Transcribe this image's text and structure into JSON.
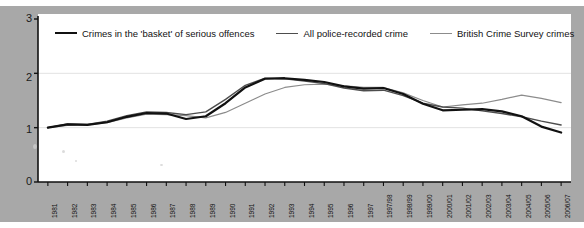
{
  "chart_data": {
    "type": "line",
    "title": "",
    "subtitle": "",
    "xlabel": "",
    "ylabel": "",
    "grid": true,
    "legend_position": "top",
    "ylim": [
      0,
      3
    ],
    "yticks": [
      "0",
      "1",
      "2",
      "3"
    ],
    "categories": [
      "1981",
      "1982",
      "1983",
      "1984",
      "1985",
      "1986",
      "1987",
      "1988",
      "1989",
      "1990",
      "1991",
      "1992",
      "1993",
      "1994",
      "1995",
      "1996",
      "1997",
      "1997/98",
      "1998/99",
      "1999/00",
      "2000/01",
      "2001/02",
      "2002/03",
      "2003/04",
      "2004/05",
      "2005/06",
      "2006/07"
    ],
    "series": [
      {
        "name": "Crimes in the 'basket' of serious offences",
        "color": "#111111",
        "width": 2.2,
        "values": [
          1.0,
          1.06,
          1.05,
          1.1,
          1.2,
          1.27,
          1.26,
          1.16,
          1.21,
          1.45,
          1.74,
          1.9,
          1.91,
          1.88,
          1.84,
          1.76,
          1.72,
          1.73,
          1.62,
          1.44,
          1.32,
          1.33,
          1.34,
          1.3,
          1.21,
          1.02,
          0.91
        ]
      },
      {
        "name": "All police-recorded crime",
        "color": "#4d4d4d",
        "width": 1.4,
        "values": [
          1.0,
          1.07,
          1.06,
          1.12,
          1.22,
          1.29,
          1.28,
          1.24,
          1.29,
          1.52,
          1.78,
          1.91,
          1.9,
          1.86,
          1.81,
          1.73,
          1.68,
          1.69,
          1.59,
          1.45,
          1.38,
          1.36,
          1.31,
          1.26,
          1.2,
          1.12,
          1.05
        ]
      },
      {
        "name": "British Crime Survey crimes",
        "color": "#8c8c8c",
        "width": 1.2,
        "values": [
          1.0,
          1.04,
          1.05,
          1.09,
          1.18,
          1.25,
          1.24,
          1.22,
          1.18,
          1.28,
          1.45,
          1.62,
          1.74,
          1.79,
          1.8,
          1.77,
          1.74,
          1.74,
          1.64,
          1.5,
          1.38,
          1.42,
          1.45,
          1.52,
          1.6,
          1.54,
          1.46
        ]
      }
    ]
  },
  "legend": {
    "items": [
      {
        "label": "Crimes in the 'basket' of serious offences"
      },
      {
        "label": "All police-recorded crime"
      },
      {
        "label": "British Crime Survey crimes"
      }
    ]
  },
  "axes": {
    "y_tick_labels": [
      "3",
      "2",
      "1",
      "0"
    ]
  }
}
